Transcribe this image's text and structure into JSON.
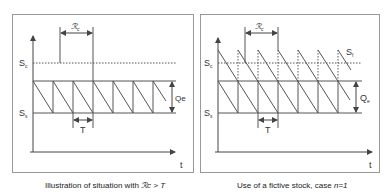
{
  "panels": [
    {
      "id": "left",
      "caption_prefix": "Illustration of situation with ",
      "caption_math": "ℛc > T",
      "labels": {
        "s_c": "S",
        "s_c_sub": "c",
        "s_s": "S",
        "s_s_sub": "s",
        "r_c": "ℛ",
        "r_c_sub": "c",
        "t_period": "T",
        "q": "Qe",
        "x_axis": "t"
      }
    },
    {
      "id": "right",
      "caption_prefix": "Use of a fictive stock, case ",
      "caption_math": "n=1",
      "labels": {
        "s_c": "S",
        "s_c_sub": "c",
        "s_s": "S",
        "s_s_sub": "s",
        "s_f": "S",
        "s_f_sub": "f",
        "r_c": "ℛ",
        "r_c_sub": "c",
        "t_period": "T",
        "q": "Q",
        "q_sub": "e",
        "x_axis": "t"
      }
    }
  ],
  "colors": {
    "line": "#555555",
    "border": "#888888",
    "text": "#333333"
  }
}
